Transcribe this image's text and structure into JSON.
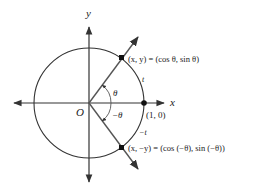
{
  "diagram": {
    "type": "unit-circle",
    "axes": {
      "x_label": "x",
      "y_label": "y",
      "origin_label": "O"
    },
    "points": {
      "upper": {
        "label": "(x, y) = (cos θ, sin θ)"
      },
      "lower": {
        "label": "(x, −y) = (cos (−θ), sin (−θ))"
      },
      "unit": {
        "label": "(1, 0)"
      }
    },
    "angles": {
      "positive": "θ",
      "negative": "−θ"
    },
    "arcs": {
      "positive": "t",
      "negative": "−t"
    }
  }
}
